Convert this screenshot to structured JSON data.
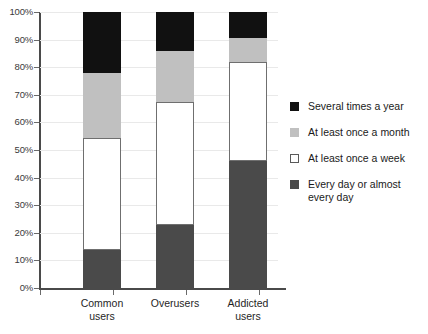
{
  "chart_data": {
    "type": "bar",
    "stacked": true,
    "orientation": "vertical",
    "title": "",
    "subtitle": "",
    "xlabel": "",
    "ylabel": "",
    "ylim": [
      0,
      100
    ],
    "grid": true,
    "legend_position": "right",
    "categories": [
      "Common users",
      "Overusers",
      "Addicted users"
    ],
    "category_lines": [
      [
        "Common",
        "users"
      ],
      [
        "Overusers",
        ""
      ],
      [
        "Addicted",
        "users"
      ]
    ],
    "ytick_labels": [
      "100%",
      "90%",
      "80%",
      "70%",
      "60%",
      "50%",
      "40%",
      "30%",
      "20%",
      "10%",
      "0%"
    ],
    "ytick_values": [
      100,
      90,
      80,
      70,
      60,
      50,
      40,
      30,
      20,
      10,
      0
    ],
    "series": [
      {
        "name": "Several times a year",
        "color": "#111111",
        "values": [
          22.0,
          14.0,
          9.5
        ],
        "cumulative_top": [
          100.0,
          100.0,
          100.0
        ],
        "cumulative_bottom": [
          78.0,
          86.0,
          90.5
        ]
      },
      {
        "name": "At least once a month",
        "color": "#c0c0c0",
        "values": [
          23.5,
          18.5,
          8.5
        ],
        "cumulative_top": [
          78.0,
          86.0,
          90.5
        ],
        "cumulative_bottom": [
          54.5,
          67.5,
          82.0
        ]
      },
      {
        "name": "At least once a week",
        "color": "#ffffff",
        "values": [
          40.7,
          44.5,
          36.0
        ],
        "cumulative_top": [
          54.5,
          67.5,
          82.0
        ],
        "cumulative_bottom": [
          13.8,
          23.0,
          46.0
        ]
      },
      {
        "name": "Every day or almost every day",
        "color": "#4a4a4a",
        "values": [
          13.8,
          23.0,
          46.0
        ],
        "cumulative_top": [
          13.8,
          23.0,
          46.0
        ],
        "cumulative_bottom": [
          0.0,
          0.0,
          0.0
        ]
      }
    ]
  },
  "legend": {
    "entries": [
      {
        "label": "Several times a year",
        "color": "#111111",
        "swatch": "filled-black"
      },
      {
        "label": "At least once a month",
        "color": "#c0c0c0",
        "swatch": "filled-light-gray"
      },
      {
        "label": "At least once a week",
        "color": "#ffffff",
        "swatch": "outlined-white"
      },
      {
        "label": "Every day or almost\never y day",
        "color": "#4a4a4a",
        "swatch": "filled-dark-gray"
      }
    ]
  },
  "colors": {
    "several_times_a_year": "#111111",
    "at_least_once_a_month": "#c0c0c0",
    "at_least_once_a_week": "#ffffff",
    "every_day": "#4a4a4a",
    "axis": "#4a4a4a",
    "gridline": "#e9e9e9",
    "background": "#ffffff"
  }
}
